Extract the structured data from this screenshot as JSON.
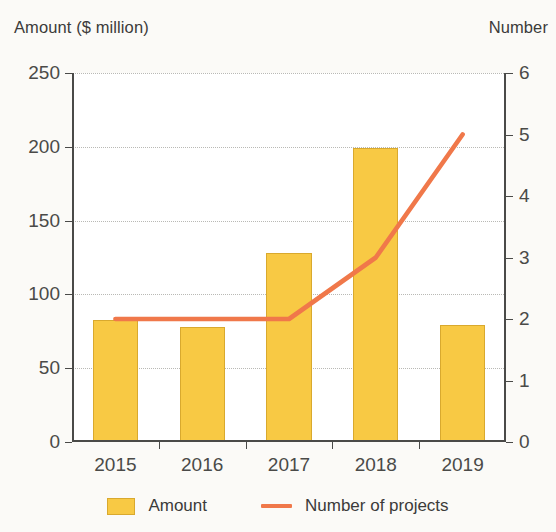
{
  "axis_titles": {
    "left": "Amount ($ million)",
    "right": "Number"
  },
  "legend": {
    "items": [
      {
        "label": "Amount",
        "marker": "bar-swatch-icon",
        "color": "#F8C944"
      },
      {
        "label": "Number of projects",
        "marker": "line-swatch-icon",
        "color": "#F0784A"
      }
    ]
  },
  "colors": {
    "bar_fill": "#F8C944",
    "bar_border": "#D9A92E",
    "line": "#F0784A",
    "axis": "#4A4A48",
    "grid": "#B9B9B5",
    "background": "#FBFAF7",
    "plot_background": "#FFFFFF"
  },
  "chart_data": {
    "type": "bar",
    "title": "",
    "subtitle": "",
    "xlabel": "",
    "ylabel": "Amount ($ million)",
    "y2label": "Number",
    "categories": [
      "2015",
      "2016",
      "2017",
      "2018",
      "2019"
    ],
    "ylim": [
      0,
      250
    ],
    "yticks": [
      0,
      50,
      100,
      150,
      200,
      250
    ],
    "ytick_labels": [
      "0",
      "50",
      "100",
      "150",
      "200",
      "250"
    ],
    "y2lim": [
      0,
      6
    ],
    "y2ticks": [
      0,
      1,
      2,
      3,
      4,
      5,
      6
    ],
    "y2tick_labels": [
      "0",
      "1",
      "2",
      "3",
      "4",
      "5",
      "6"
    ],
    "grid": true,
    "legend_position": "bottom",
    "series": [
      {
        "name": "Amount",
        "type": "bar",
        "axis": "left",
        "unit": "$ million",
        "values": [
          83,
          78,
          128,
          199,
          79
        ]
      },
      {
        "name": "Number of projects",
        "type": "line",
        "axis": "right",
        "unit": "projects",
        "values": [
          2,
          2,
          2,
          3,
          5
        ]
      }
    ]
  }
}
